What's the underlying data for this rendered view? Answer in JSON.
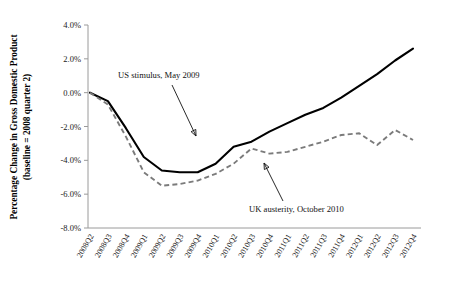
{
  "chart_data": {
    "type": "line",
    "title": "",
    "xlabel": "",
    "ylabel": "Percentage Change in Gross Domestic Product",
    "ylabel_line2": "(baseline = 2008 quarter 2)",
    "ylim": [
      -8.0,
      4.0
    ],
    "ytick_values": [
      4.0,
      2.0,
      0.0,
      -2.0,
      -4.0,
      -6.0,
      -8.0
    ],
    "ytick_labels": [
      "4.0%",
      "2.0%",
      "0.0%",
      "-2.0%",
      "-4.0%",
      "-6.0%",
      "-8.0%"
    ],
    "grid": false,
    "legend": "none",
    "categories": [
      "2008Q2",
      "2008Q3",
      "2008Q4",
      "2009Q1",
      "2009Q2",
      "2009Q3",
      "2009Q4",
      "2010Q1",
      "2010Q2",
      "2010Q3",
      "2010Q4",
      "2011Q1",
      "2011Q2",
      "2011Q3",
      "2011Q4",
      "2012Q1",
      "2012Q2",
      "2012Q3",
      "2012Q4"
    ],
    "series": [
      {
        "name": "United States",
        "style": "solid",
        "color": "#000000",
        "values": [
          0.0,
          -0.5,
          -2.1,
          -3.8,
          -4.6,
          -4.7,
          -4.7,
          -4.2,
          -3.2,
          -2.9,
          -2.3,
          -1.8,
          -1.3,
          -0.9,
          -0.3,
          0.4,
          1.1,
          1.9,
          2.6
        ]
      },
      {
        "name": "United Kingdom",
        "style": "dashed",
        "color": "#7b7b7b",
        "values": [
          0.0,
          -0.7,
          -2.6,
          -4.7,
          -5.5,
          -5.4,
          -5.2,
          -4.8,
          -4.2,
          -3.3,
          -3.6,
          -3.5,
          -3.2,
          -2.9,
          -2.5,
          -2.4,
          -3.1,
          -2.2,
          -2.8
        ]
      }
    ],
    "annotations": [
      {
        "text": "US stimulus, May 2009",
        "text_x": 118,
        "text_y": 78,
        "arrow_from_x": 172,
        "arrow_from_y": 85,
        "arrow_to_x": 196,
        "arrow_to_y": 136
      },
      {
        "text": "UK austerity, October 2010",
        "text_x": 249,
        "text_y": 212,
        "arrow_from_x": 283,
        "arrow_from_y": 201,
        "arrow_to_x": 264,
        "arrow_to_y": 163
      }
    ]
  }
}
